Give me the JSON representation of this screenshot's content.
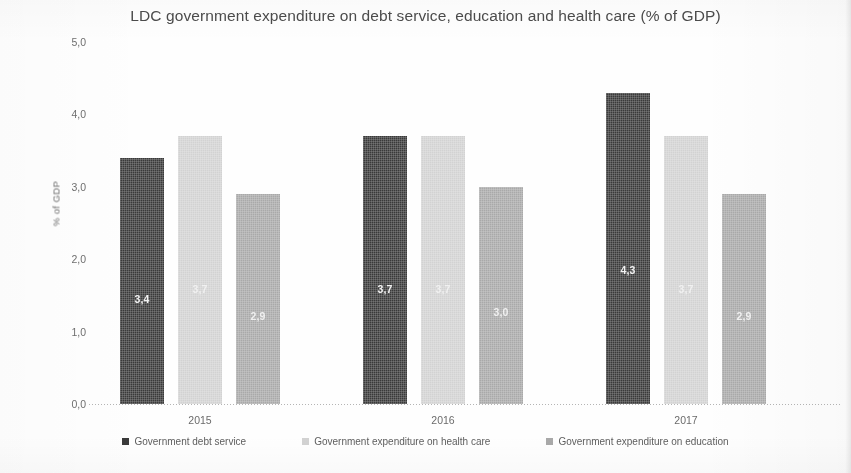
{
  "chart_data": {
    "type": "bar",
    "title": "LDC government expenditure on debt service, education and health care (% of GDP)",
    "xlabel": "",
    "ylabel": "% of GDP",
    "ylim": [
      0,
      5
    ],
    "grid": false,
    "legend_position": "bottom",
    "decimal_separator": ",",
    "categories": [
      "2015",
      "2016",
      "2017"
    ],
    "tick_labels": [
      "5,0",
      "4,0",
      "3,0",
      "2,0",
      "1,0",
      "0,0"
    ],
    "tick_values": [
      5,
      4,
      3,
      2,
      1,
      0
    ],
    "series": [
      {
        "name": "Government debt service",
        "key": "debt",
        "color": "#3a3a3a",
        "values": [
          3.4,
          3.7,
          4.3
        ],
        "labels": [
          "3,4",
          "3,7",
          "4,3"
        ]
      },
      {
        "name": "Government expenditure on health care",
        "key": "health",
        "color": "#d2d2d2",
        "values": [
          3.7,
          3.7,
          3.7
        ],
        "labels": [
          "3,7",
          "3,7",
          "3,7"
        ]
      },
      {
        "name": "Government expenditure on education",
        "key": "education",
        "color": "#a9a9a9",
        "values": [
          2.9,
          3.0,
          2.9
        ],
        "labels": [
          "2,9",
          "3,0",
          "2,9"
        ]
      }
    ]
  }
}
